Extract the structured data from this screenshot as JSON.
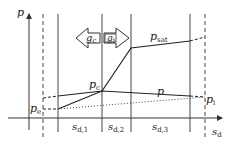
{
  "diagram": {
    "axes": {
      "y_label": "p",
      "x_label_main": "s",
      "x_label_sub": "d"
    },
    "flux_arrows": [
      {
        "label_main": "g",
        "label_sub": "c",
        "direction": "left"
      },
      {
        "label_main": "g",
        "label_sub": "i",
        "direction": "right"
      }
    ],
    "curve_labels": {
      "p_sat_main": "p",
      "p_sat_sub": "sat",
      "p_main": "p",
      "p_c_main": "p",
      "p_c_sub": "c",
      "p_e_main": "p",
      "p_e_sub": "e",
      "p_i_main": "p",
      "p_i_sub": "i"
    },
    "segments": [
      {
        "main": "s",
        "sub": "d,1"
      },
      {
        "main": "s",
        "sub": "d,2"
      },
      {
        "main": "s",
        "sub": "d,3"
      }
    ]
  }
}
